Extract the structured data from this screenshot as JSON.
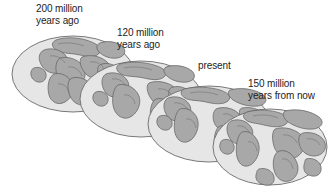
{
  "figure": {
    "background_color": "#ffffff",
    "ocean_color": "#e6e6e6",
    "land_color": "#a8a8a8",
    "outline_color": "#5a5a5a",
    "text_color": "#1d1d1d"
  },
  "globes": [
    {
      "id": "globe-200-mya",
      "caption_lines": [
        "200 million",
        "years ago"
      ],
      "caption": "200 million years ago",
      "stage": "Pangaea",
      "order": 1
    },
    {
      "id": "globe-120-mya",
      "caption_lines": [
        "120 million",
        "years ago"
      ],
      "caption": "120 million years ago",
      "stage": "Early rifting",
      "order": 2
    },
    {
      "id": "globe-present",
      "caption_lines": [
        "present"
      ],
      "caption": "present",
      "stage": "Present day",
      "order": 3
    },
    {
      "id": "globe-150-my-future",
      "caption_lines": [
        "150 million",
        "years from now"
      ],
      "caption": "150 million years from now",
      "stage": "Projected future",
      "order": 4
    }
  ]
}
